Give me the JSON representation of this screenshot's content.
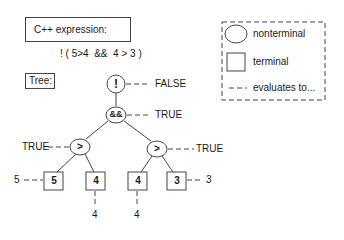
{
  "expression_panel": {
    "title": "C++ expression:",
    "expression": "! ( 5>4  &&  4 > 3 )"
  },
  "tree_panel": {
    "title": "Tree:"
  },
  "tree": {
    "not_node": {
      "label": "!",
      "value": "FALSE"
    },
    "and_node": {
      "label": "&&",
      "value": "TRUE"
    },
    "gt_left": {
      "label": ">",
      "value": "TRUE"
    },
    "gt_right": {
      "label": ">",
      "value": "TRUE"
    },
    "terminals": [
      {
        "label": "5",
        "value": "5"
      },
      {
        "label": "4",
        "value": "4"
      },
      {
        "label": "4",
        "value": "4"
      },
      {
        "label": "3",
        "value": "3"
      }
    ]
  },
  "legend": {
    "items": [
      {
        "shape": "circle",
        "label": "nonterminal"
      },
      {
        "shape": "square",
        "label": "terminal"
      },
      {
        "shape": "dash",
        "label": "evaluates to..."
      }
    ]
  },
  "colors": {
    "stroke": "#444444",
    "text": "#1a1a1a",
    "background": "#ffffff"
  }
}
